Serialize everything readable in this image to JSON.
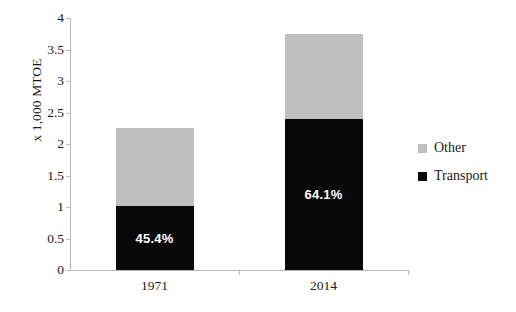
{
  "chart_data": {
    "type": "bar",
    "subtype": "stacked-bar",
    "title": "",
    "xlabel": "",
    "ylabel": "x 1,000 MTOE",
    "categories": [
      "1971",
      "2014"
    ],
    "series": [
      {
        "name": "Transport",
        "color": "#090909",
        "values": [
          1.02,
          2.4
        ]
      },
      {
        "name": "Other",
        "color": "#bfbfbf",
        "values": [
          1.23,
          1.35
        ]
      }
    ],
    "totals": [
      2.25,
      3.75
    ],
    "data_labels": [
      "45.4%",
      "64.1%"
    ],
    "ylim": [
      0,
      4
    ],
    "yticks": [
      "0",
      "0.5",
      "1",
      "1.5",
      "2",
      "2.5",
      "3",
      "3.5",
      "4"
    ],
    "ytick_values": [
      0,
      0.5,
      1,
      1.5,
      2,
      2.5,
      3,
      3.5,
      4
    ],
    "grid": false,
    "legend_position": "right",
    "legend": [
      "Other",
      "Transport"
    ]
  },
  "axis": {
    "y_title": "x 1,000 MTOE"
  },
  "legend": {
    "items": [
      {
        "label": "Other",
        "color": "#bfbfbf"
      },
      {
        "label": "Transport",
        "color": "#090909"
      }
    ]
  },
  "colors": {
    "other": "#bfbfbf",
    "transport": "#090909",
    "axis": "#b7b7b7",
    "text": "#1a1a1a",
    "label_text": "#ffffff",
    "background": "#ffffff"
  }
}
